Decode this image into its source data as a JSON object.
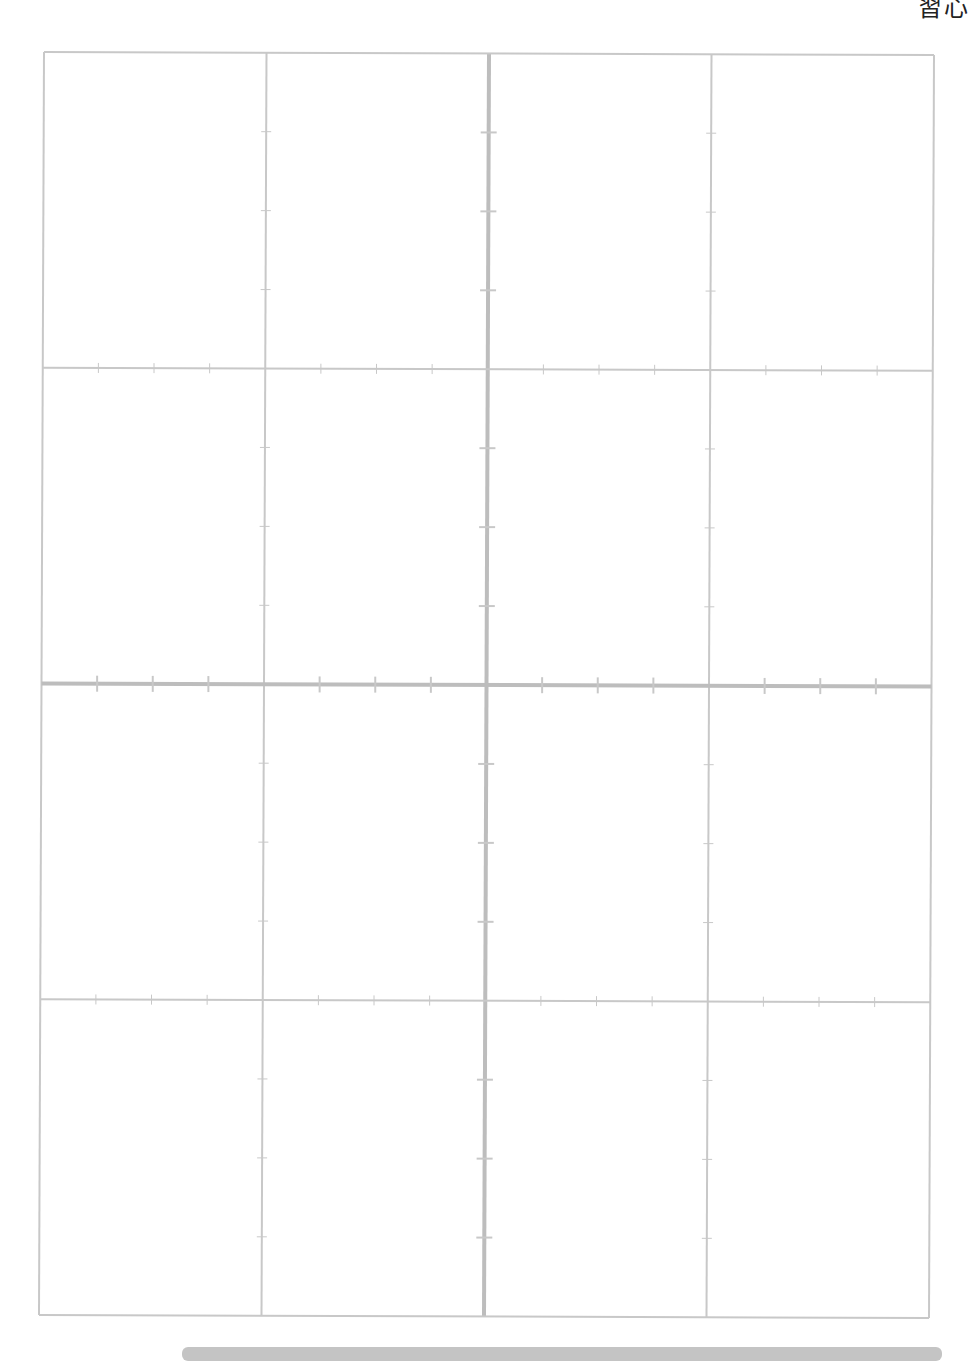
{
  "header": {
    "title_fragment": "習心"
  },
  "sheet": {
    "type": "practice-grid",
    "rows": 4,
    "columns": 4,
    "line_color": "#c8c8c8",
    "center_line_color": "#bdbdbd",
    "ticks_per_cell_edge": 3
  },
  "footer": {
    "bar_color": "#c4c4c4"
  }
}
